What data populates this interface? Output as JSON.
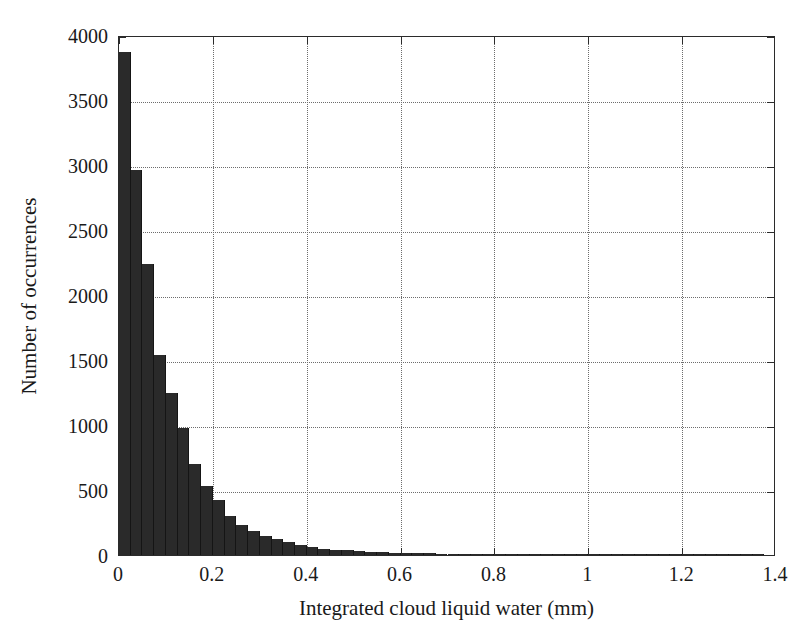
{
  "chart_data": {
    "type": "bar",
    "title": "",
    "xlabel": "Integrated cloud liquid water (mm)",
    "ylabel": "Number of occurrences",
    "xlim": [
      0,
      1.4
    ],
    "ylim": [
      0,
      4000
    ],
    "grid": true,
    "legend": null,
    "bin_width": 0.025,
    "bar_color": "#2a2a2a",
    "axis_color": "#2b2b2b",
    "grid_color": "#6d6d6d",
    "xticks": [
      0,
      0.2,
      0.4,
      0.6,
      0.8,
      1,
      1.2,
      1.4
    ],
    "xtick_labels": [
      "0",
      "0.2",
      "0.4",
      "0.6",
      "0.8",
      "1",
      "1.2",
      "1.4"
    ],
    "yticks": [
      0,
      500,
      1000,
      1500,
      2000,
      2500,
      3000,
      3500,
      4000
    ],
    "ytick_labels": [
      "0",
      "500",
      "1000",
      "1500",
      "2000",
      "2500",
      "3000",
      "3500",
      "4000"
    ],
    "bin_edges": [
      0,
      0.025,
      0.05,
      0.075,
      0.1,
      0.125,
      0.15,
      0.175,
      0.2,
      0.225,
      0.25,
      0.275,
      0.3,
      0.325,
      0.35,
      0.375,
      0.4,
      0.425,
      0.45,
      0.475,
      0.5,
      0.525,
      0.55,
      0.575,
      0.6,
      0.625,
      0.65,
      0.675,
      0.7,
      0.725,
      0.75,
      0.775,
      0.8,
      0.825,
      0.85,
      0.875,
      0.9,
      0.925,
      0.95,
      0.975,
      1.0,
      1.025,
      1.05,
      1.075,
      1.1,
      1.125,
      1.15,
      1.175,
      1.2,
      1.225,
      1.25,
      1.275,
      1.3,
      1.325,
      1.35,
      1.375,
      1.4
    ],
    "values": [
      3870,
      2960,
      2240,
      1540,
      1250,
      980,
      700,
      530,
      420,
      300,
      230,
      185,
      150,
      120,
      100,
      80,
      62,
      50,
      42,
      36,
      30,
      26,
      22,
      19,
      16,
      14,
      12,
      11,
      10,
      9,
      8,
      7,
      6,
      6,
      5,
      5,
      4,
      4,
      3,
      3,
      3,
      2,
      2,
      2,
      2,
      2,
      1,
      1,
      1,
      1,
      1,
      1,
      3,
      3,
      1,
      0
    ]
  }
}
